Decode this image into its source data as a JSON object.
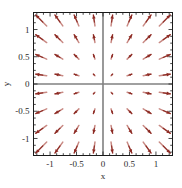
{
  "chart_data": {
    "type": "scatter",
    "plot_kind": "vector-field",
    "title": "",
    "xlabel": "x",
    "ylabel": "y",
    "xlim": [
      -1.3125,
      1.3125
    ],
    "ylim": [
      -1.3125,
      1.3125
    ],
    "grid": false,
    "legend": null,
    "xticks": [
      -1,
      -0.5,
      0,
      0.5,
      1
    ],
    "xtick_labels": [
      "-1",
      "-0.5",
      "0",
      "0.5",
      "1"
    ],
    "yticks": [
      -1,
      -0.5,
      0,
      0.5,
      1
    ],
    "ytick_labels": [
      "-1",
      "-0.5",
      "0",
      "0.5",
      "1"
    ],
    "minor_tick_step": 0.125,
    "ticks_on_all_sides": true,
    "tick_direction": "in",
    "field_description": "radial outward vector field; arrows point away from the origin with magnitude increasing with distance from origin",
    "arrow_color": "#8c2b24",
    "arrow_tail_color": "#c98a84",
    "axis_line_color": "#808080",
    "frame_color": "#1a1a1a",
    "background_color": "#ffffff",
    "grid_x": [
      -1.1667,
      -0.8333,
      -0.5,
      -0.1667,
      0.1667,
      0.5,
      0.8333,
      1.1667
    ],
    "grid_y": [
      -1.1667,
      -0.8333,
      -0.5,
      -0.1667,
      0.1667,
      0.5,
      0.8333,
      1.1667
    ],
    "vectors": [
      {
        "x": -1.1667,
        "y": 1.1667,
        "u": -1.1667,
        "v": 1.1667
      },
      {
        "x": -0.8333,
        "y": 1.1667,
        "u": -0.8333,
        "v": 1.1667
      },
      {
        "x": -0.5,
        "y": 1.1667,
        "u": -0.5,
        "v": 1.1667
      },
      {
        "x": -0.1667,
        "y": 1.1667,
        "u": -0.1667,
        "v": 1.1667
      },
      {
        "x": 0.1667,
        "y": 1.1667,
        "u": 0.1667,
        "v": 1.1667
      },
      {
        "x": 0.5,
        "y": 1.1667,
        "u": 0.5,
        "v": 1.1667
      },
      {
        "x": 0.8333,
        "y": 1.1667,
        "u": 0.8333,
        "v": 1.1667
      },
      {
        "x": 1.1667,
        "y": 1.1667,
        "u": 1.1667,
        "v": 1.1667
      },
      {
        "x": -1.1667,
        "y": 0.8333,
        "u": -1.1667,
        "v": 0.8333
      },
      {
        "x": -0.8333,
        "y": 0.8333,
        "u": -0.8333,
        "v": 0.8333
      },
      {
        "x": -0.5,
        "y": 0.8333,
        "u": -0.5,
        "v": 0.8333
      },
      {
        "x": -0.1667,
        "y": 0.8333,
        "u": -0.1667,
        "v": 0.8333
      },
      {
        "x": 0.1667,
        "y": 0.8333,
        "u": 0.1667,
        "v": 0.8333
      },
      {
        "x": 0.5,
        "y": 0.8333,
        "u": 0.5,
        "v": 0.8333
      },
      {
        "x": 0.8333,
        "y": 0.8333,
        "u": 0.8333,
        "v": 0.8333
      },
      {
        "x": 1.1667,
        "y": 0.8333,
        "u": 1.1667,
        "v": 0.8333
      },
      {
        "x": -1.1667,
        "y": 0.5,
        "u": -1.1667,
        "v": 0.5
      },
      {
        "x": -0.8333,
        "y": 0.5,
        "u": -0.8333,
        "v": 0.5
      },
      {
        "x": -0.5,
        "y": 0.5,
        "u": -0.5,
        "v": 0.5
      },
      {
        "x": -0.1667,
        "y": 0.5,
        "u": -0.1667,
        "v": 0.5
      },
      {
        "x": 0.1667,
        "y": 0.5,
        "u": 0.1667,
        "v": 0.5
      },
      {
        "x": 0.5,
        "y": 0.5,
        "u": 0.5,
        "v": 0.5
      },
      {
        "x": 0.8333,
        "y": 0.5,
        "u": 0.8333,
        "v": 0.5
      },
      {
        "x": 1.1667,
        "y": 0.5,
        "u": 1.1667,
        "v": 0.5
      },
      {
        "x": -1.1667,
        "y": 0.1667,
        "u": -1.1667,
        "v": 0.1667
      },
      {
        "x": -0.8333,
        "y": 0.1667,
        "u": -0.8333,
        "v": 0.1667
      },
      {
        "x": -0.5,
        "y": 0.1667,
        "u": -0.5,
        "v": 0.1667
      },
      {
        "x": -0.1667,
        "y": 0.1667,
        "u": -0.1667,
        "v": 0.1667
      },
      {
        "x": 0.1667,
        "y": 0.1667,
        "u": 0.1667,
        "v": 0.1667
      },
      {
        "x": 0.5,
        "y": 0.1667,
        "u": 0.5,
        "v": 0.1667
      },
      {
        "x": 0.8333,
        "y": 0.1667,
        "u": 0.8333,
        "v": 0.1667
      },
      {
        "x": 1.1667,
        "y": 0.1667,
        "u": 1.1667,
        "v": 0.1667
      },
      {
        "x": -1.1667,
        "y": -0.1667,
        "u": -1.1667,
        "v": -0.1667
      },
      {
        "x": -0.8333,
        "y": -0.1667,
        "u": -0.8333,
        "v": -0.1667
      },
      {
        "x": -0.5,
        "y": -0.1667,
        "u": -0.5,
        "v": -0.1667
      },
      {
        "x": -0.1667,
        "y": -0.1667,
        "u": -0.1667,
        "v": -0.1667
      },
      {
        "x": 0.1667,
        "y": -0.1667,
        "u": 0.1667,
        "v": -0.1667
      },
      {
        "x": 0.5,
        "y": -0.1667,
        "u": 0.5,
        "v": -0.1667
      },
      {
        "x": 0.8333,
        "y": -0.1667,
        "u": 0.8333,
        "v": -0.1667
      },
      {
        "x": 1.1667,
        "y": -0.1667,
        "u": 1.1667,
        "v": -0.1667
      },
      {
        "x": -1.1667,
        "y": -0.5,
        "u": -1.1667,
        "v": -0.5
      },
      {
        "x": -0.8333,
        "y": -0.5,
        "u": -0.8333,
        "v": -0.5
      },
      {
        "x": -0.5,
        "y": -0.5,
        "u": -0.5,
        "v": -0.5
      },
      {
        "x": -0.1667,
        "y": -0.5,
        "u": -0.1667,
        "v": -0.5
      },
      {
        "x": 0.1667,
        "y": -0.5,
        "u": 0.1667,
        "v": -0.5
      },
      {
        "x": 0.5,
        "y": -0.5,
        "u": 0.5,
        "v": -0.5
      },
      {
        "x": 0.8333,
        "y": -0.5,
        "u": 0.8333,
        "v": -0.5
      },
      {
        "x": 1.1667,
        "y": -0.5,
        "u": 1.1667,
        "v": -0.5
      },
      {
        "x": -1.1667,
        "y": -0.8333,
        "u": -1.1667,
        "v": -0.8333
      },
      {
        "x": -0.8333,
        "y": -0.8333,
        "u": -0.8333,
        "v": -0.8333
      },
      {
        "x": -0.5,
        "y": -0.8333,
        "u": -0.5,
        "v": -0.8333
      },
      {
        "x": -0.1667,
        "y": -0.8333,
        "u": -0.1667,
        "v": -0.8333
      },
      {
        "x": 0.1667,
        "y": -0.8333,
        "u": 0.1667,
        "v": -0.8333
      },
      {
        "x": 0.5,
        "y": -0.8333,
        "u": 0.5,
        "v": -0.8333
      },
      {
        "x": 0.8333,
        "y": -0.8333,
        "u": 0.8333,
        "v": -0.8333
      },
      {
        "x": 1.1667,
        "y": -0.8333,
        "u": 1.1667,
        "v": -0.8333
      },
      {
        "x": -1.1667,
        "y": -1.1667,
        "u": -1.1667,
        "v": -1.1667
      },
      {
        "x": -0.8333,
        "y": -1.1667,
        "u": -0.8333,
        "v": -1.1667
      },
      {
        "x": -0.5,
        "y": -1.1667,
        "u": -0.5,
        "v": -1.1667
      },
      {
        "x": -0.1667,
        "y": -1.1667,
        "u": -0.1667,
        "v": -1.1667
      },
      {
        "x": 0.1667,
        "y": -1.1667,
        "u": 0.1667,
        "v": -1.1667
      },
      {
        "x": 0.5,
        "y": -1.1667,
        "u": 0.5,
        "v": -1.1667
      },
      {
        "x": 0.8333,
        "y": -1.1667,
        "u": 0.8333,
        "v": -1.1667
      },
      {
        "x": 1.1667,
        "y": -1.1667,
        "u": 1.1667,
        "v": -1.1667
      }
    ]
  }
}
